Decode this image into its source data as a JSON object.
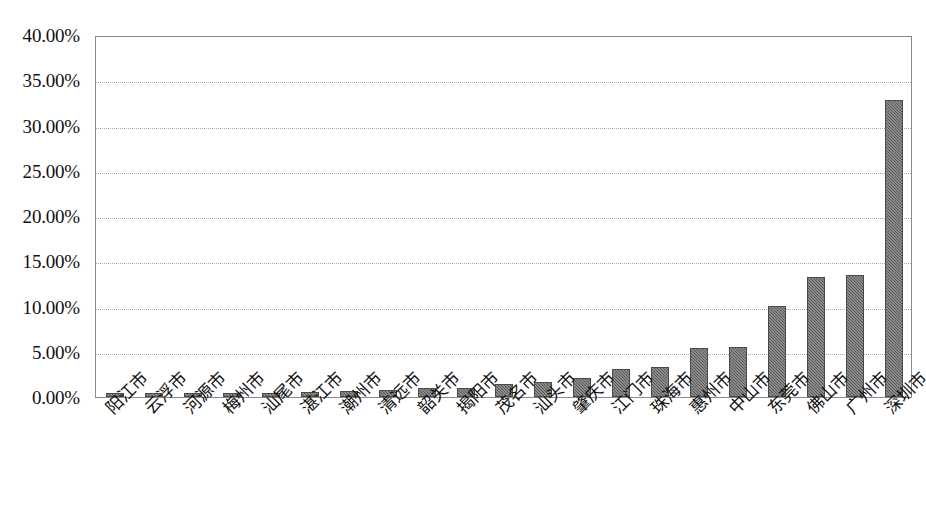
{
  "chart_data": {
    "type": "bar",
    "title": "",
    "subtitle": "",
    "xlabel": "",
    "ylabel": "",
    "ylim": [
      0,
      40
    ],
    "ytick_step": 5,
    "ytick_labels": [
      "0.00%",
      "5.00%",
      "10.00%",
      "15.00%",
      "20.00%",
      "25.00%",
      "30.00%",
      "35.00%",
      "40.00%"
    ],
    "ytick_values": [
      0,
      5,
      10,
      15,
      20,
      25,
      30,
      35,
      40
    ],
    "grid": true,
    "legend": false,
    "legend_position": "none",
    "bar_color": "#595959",
    "categories": [
      "阳江市",
      "云浮市",
      "河源市",
      "梅州市",
      "汕尾市",
      "湛江市",
      "潮州市",
      "清远市",
      "韶关市",
      "揭阳市",
      "茂名市",
      "汕头市",
      "肇庆市",
      "江门市",
      "珠海市",
      "惠州市",
      "中山市",
      "东莞市",
      "佛山市",
      "广州市",
      "深圳市"
    ],
    "values": [
      0.45,
      0.42,
      0.4,
      0.42,
      0.45,
      0.6,
      0.65,
      0.75,
      0.95,
      1.05,
      1.45,
      1.7,
      2.1,
      3.05,
      3.3,
      5.4,
      5.5,
      10.1,
      13.25,
      13.5,
      32.85
    ],
    "value_labels": [
      "0.45%",
      "0.42%",
      "0.40%",
      "0.42%",
      "0.45%",
      "0.60%",
      "0.65%",
      "0.75%",
      "0.95%",
      "1.05%",
      "1.45%",
      "1.70%",
      "2.10%",
      "3.05%",
      "3.30%",
      "5.40%",
      "5.50%",
      "10.10%",
      "13.25%",
      "13.50%",
      "32.85%"
    ]
  }
}
